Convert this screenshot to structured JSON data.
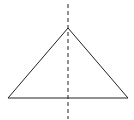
{
  "diagram": {
    "type": "isosceles-triangle-with-symmetry-axis",
    "colors": {
      "stroke": "#222222",
      "axis": "#222222",
      "background": "#ffffff"
    },
    "triangle": {
      "apex": [
        68,
        28
      ],
      "base_left": [
        8,
        98
      ],
      "base_right": [
        128,
        98
      ]
    },
    "axis": {
      "x": 68,
      "y1": 4,
      "y2": 119,
      "dash": "4 3"
    }
  }
}
